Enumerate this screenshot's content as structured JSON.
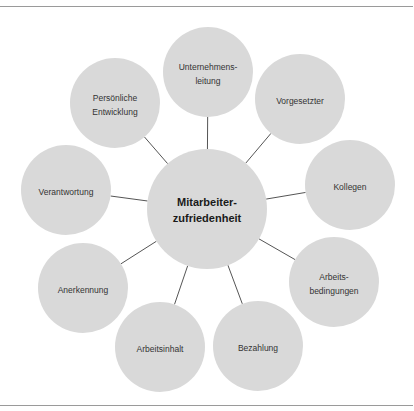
{
  "diagram": {
    "colors": {
      "circle_fill": "#d9d9d9",
      "connector": "#555555",
      "rule": "#9a9a9a",
      "text": "#333333"
    },
    "center": {
      "id": "mitarbeiterzufriedenheit",
      "lines": [
        "Mitarbeiter-",
        "zufriedenheit"
      ],
      "cx": 207,
      "cy": 209,
      "r": 60
    },
    "nodes": [
      {
        "id": "unternehmensleitung",
        "lines": [
          "Unternehmens-",
          "leitung"
        ],
        "cx": 208,
        "cy": 72,
        "r": 45
      },
      {
        "id": "vorgesetzter",
        "lines": [
          "Vorgesetzter"
        ],
        "cx": 300,
        "cy": 99,
        "r": 45
      },
      {
        "id": "kollegen",
        "lines": [
          "Kollegen"
        ],
        "cx": 350,
        "cy": 185,
        "r": 45
      },
      {
        "id": "arbeitsbedingungen",
        "lines": [
          "Arbeits-",
          "bedingungen"
        ],
        "cx": 334,
        "cy": 282,
        "r": 45
      },
      {
        "id": "bezahlung",
        "lines": [
          "Bezahlung"
        ],
        "cx": 258,
        "cy": 346,
        "r": 45
      },
      {
        "id": "arbeitsinhalt",
        "lines": [
          "Arbeitsinhalt"
        ],
        "cx": 160,
        "cy": 347,
        "r": 45
      },
      {
        "id": "anerkennung",
        "lines": [
          "Anerkennung"
        ],
        "cx": 83,
        "cy": 288,
        "r": 45
      },
      {
        "id": "verantwortung",
        "lines": [
          "Verantwortung"
        ],
        "cx": 66,
        "cy": 190,
        "r": 45
      },
      {
        "id": "persoenliche-entwicklung",
        "lines": [
          "Persönliche",
          "Entwicklung"
        ],
        "cx": 115,
        "cy": 103,
        "r": 45
      }
    ]
  }
}
